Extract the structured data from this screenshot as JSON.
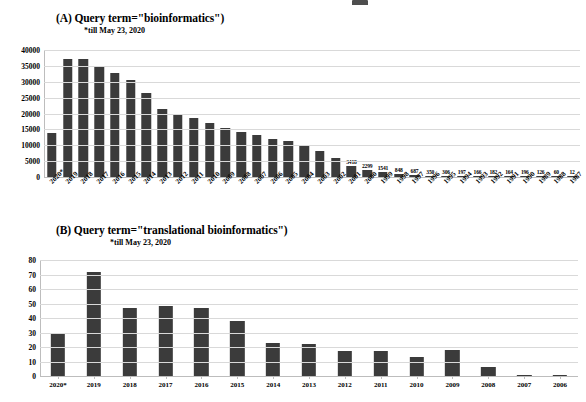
{
  "chart_data": [
    {
      "id": "panel-a",
      "type": "bar",
      "title": "(A) Query term=\"bioinformatics\")",
      "subtitle": "*till May 23, 2020",
      "xlabel": "",
      "ylabel": "",
      "ylim": [
        0,
        40000
      ],
      "yticks": [
        "0",
        "5000",
        "10000",
        "15000",
        "20000",
        "25000",
        "30000",
        "35000",
        "40000"
      ],
      "ytick_values": [
        0,
        5000,
        10000,
        15000,
        20000,
        25000,
        30000,
        35000,
        40000
      ],
      "grid": true,
      "legend": "none",
      "categories": [
        "2020*",
        "2019",
        "2018",
        "2017",
        "2016",
        "2015",
        "2014",
        "2013",
        "2012",
        "2011",
        "2010",
        "2009",
        "2008",
        "2007",
        "2006",
        "2005",
        "2004",
        "2003",
        "2002",
        "2001",
        "2000",
        "1999",
        "1998",
        "1997",
        "1996",
        "1995",
        "1994",
        "1993",
        "1992",
        "1991",
        "1990",
        "1989",
        "1988",
        "1987"
      ],
      "values": [
        13800,
        37300,
        37300,
        34900,
        32800,
        30400,
        26600,
        21400,
        19900,
        18500,
        17000,
        15500,
        14200,
        13100,
        12000,
        11200,
        9700,
        8200,
        5900,
        3418,
        2299,
        1541,
        848,
        687,
        350,
        306,
        197,
        166,
        182,
        164,
        196,
        126,
        60,
        12,
        11
      ],
      "point_labels": [
        "",
        "",
        "",
        "",
        "",
        "",
        "",
        "",
        "",
        "",
        "",
        "",
        "",
        "",
        "",
        "",
        "",
        "",
        "",
        "3418",
        "2299",
        "1541",
        "848",
        "687",
        "350",
        "306",
        "197",
        "166",
        "182",
        "164",
        "196",
        "126",
        "60",
        "12",
        "11"
      ]
    },
    {
      "id": "panel-b",
      "type": "bar",
      "title": "(B) Query term=\"translational bioinformatics\")",
      "subtitle": "*till May 23, 2020",
      "xlabel": "",
      "ylabel": "",
      "ylim": [
        0,
        80
      ],
      "yticks": [
        "0",
        "10",
        "20",
        "30",
        "40",
        "50",
        "60",
        "70",
        "80"
      ],
      "ytick_values": [
        0,
        10,
        20,
        30,
        40,
        50,
        60,
        70,
        80
      ],
      "grid": true,
      "legend": "none",
      "categories": [
        "2020*",
        "2019",
        "2018",
        "2017",
        "2016",
        "2015",
        "2014",
        "2013",
        "2012",
        "2011",
        "2010",
        "2009",
        "2008",
        "2007",
        "2006"
      ],
      "values": [
        30,
        72,
        47,
        48,
        47,
        38,
        23,
        22,
        17,
        17,
        13,
        18,
        6,
        1,
        1
      ]
    }
  ],
  "style": {
    "bar_color": "#3b3b3b",
    "grid_color": "#d9d9d9",
    "axis_color": "#bdbdbd",
    "background": "#ffffff",
    "text_color": "#000000"
  }
}
